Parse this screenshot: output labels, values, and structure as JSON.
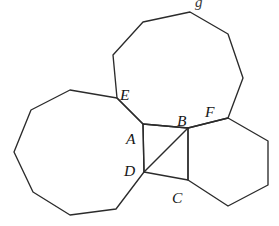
{
  "figure": {
    "canvas": {
      "width": 279,
      "height": 226
    },
    "stroke_color": "#2b2b2b",
    "background_color": "#ffffff",
    "label_color": "#161616"
  },
  "labels": [
    {
      "id": "A",
      "text": "A",
      "x": 126,
      "y": 131,
      "name": "vertex-label-a"
    },
    {
      "id": "B",
      "text": "B",
      "x": 177,
      "y": 113,
      "name": "vertex-label-b"
    },
    {
      "id": "C",
      "text": "C",
      "x": 172,
      "y": 190,
      "name": "vertex-label-c"
    },
    {
      "id": "D",
      "text": "D",
      "x": 124,
      "y": 163,
      "name": "vertex-label-d"
    },
    {
      "id": "E",
      "text": "E",
      "x": 120,
      "y": 87,
      "name": "vertex-label-e"
    },
    {
      "id": "F",
      "text": "F",
      "x": 205,
      "y": 104,
      "name": "vertex-label-f"
    }
  ],
  "shapes": {
    "left_nonagon": {
      "name": "left-nonagon",
      "sides": 9,
      "points": "143,124 117,98 70,90 31,110 14,152 33,192 70,215 116,209 144,172"
    },
    "top_nonagon": {
      "name": "top-nonagon",
      "sides": 9,
      "points": "117,98 113,55 143,22 190,12 228,34 243,78 228,118 188,128 143,124"
    },
    "right_hexagon": {
      "name": "right-hexagon",
      "sides": 6,
      "points": "188,128 228,118 268,141 268,185 228,206 188,180"
    },
    "center_square": {
      "name": "center-square",
      "sides": 4,
      "points": "143,124 188,128 188,180 144,172"
    },
    "diagonal": {
      "name": "square-diagonal-db",
      "x1": 144,
      "y1": 172,
      "x2": 188,
      "y2": 128
    }
  },
  "partial_marks": {
    "top_clipped_glyph": "g"
  }
}
